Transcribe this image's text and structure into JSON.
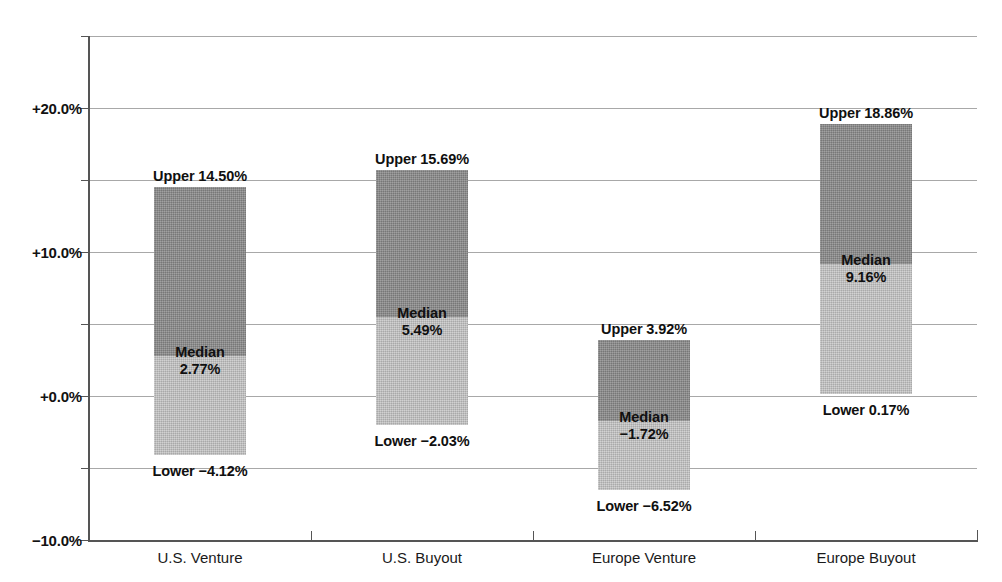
{
  "chart_data": {
    "type": "bar",
    "title": "",
    "xlabel": "",
    "ylabel": "",
    "categories": [
      "U.S. Venture",
      "U.S. Buyout",
      "Europe Venture",
      "Europe Buyout"
    ],
    "ylim": [
      -10.0,
      25.0
    ],
    "ytick_values": [
      20.0,
      10.0,
      0.0,
      -10.0
    ],
    "ytick_labels": [
      "+20.0%",
      "+10.0%",
      "+0.0%",
      "−10.0%"
    ],
    "gridline_values": [
      25.0,
      20.0,
      15.0,
      10.0,
      5.0,
      0.0,
      -5.0,
      -10.0
    ],
    "grid": true,
    "legend": "none",
    "series": [
      {
        "name": "Upper",
        "values": [
          14.5,
          15.69,
          3.92,
          18.86
        ]
      },
      {
        "name": "Median",
        "values": [
          2.77,
          5.49,
          -1.72,
          9.16
        ]
      },
      {
        "name": "Lower",
        "values": [
          -4.12,
          -2.03,
          -6.52,
          0.17
        ]
      }
    ],
    "bars": [
      {
        "category": "U.S. Venture",
        "upper": 14.5,
        "median": 2.77,
        "lower": -4.12,
        "upper_label": "Upper 14.50%",
        "median_word": "Median",
        "median_label": "2.77%",
        "lower_label": "Lower −4.12%"
      },
      {
        "category": "U.S. Buyout",
        "upper": 15.69,
        "median": 5.49,
        "lower": -2.03,
        "upper_label": "Upper 15.69%",
        "median_word": "Median",
        "median_label": "5.49%",
        "lower_label": "Lower −2.03%"
      },
      {
        "category": "Europe Venture",
        "upper": 3.92,
        "median": -1.72,
        "lower": -6.52,
        "upper_label": "Upper 3.92%",
        "median_word": "Median",
        "median_label": "−1.72%",
        "lower_label": "Lower −6.52%"
      },
      {
        "category": "Europe Buyout",
        "upper": 18.86,
        "median": 9.16,
        "lower": 0.17,
        "upper_label": "Upper 18.86%",
        "median_word": "Median",
        "median_label": "9.16%",
        "lower_label": "Lower 0.17%"
      }
    ],
    "colors": {
      "upper_segment": "#8a8a8a",
      "lower_segment": "#bfbfbf",
      "gridline": "#a8a8a8",
      "axis": "#555555",
      "text": "#101010"
    }
  }
}
